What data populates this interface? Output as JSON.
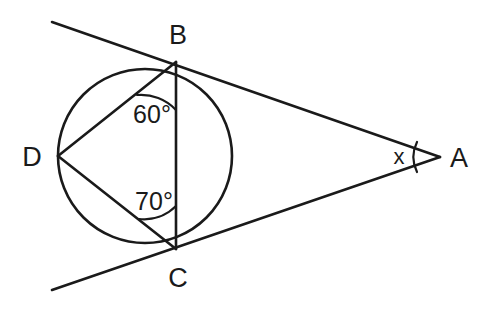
{
  "figure": {
    "type": "circle-geometry-diagram",
    "background_color": "#ffffff",
    "stroke_color": "#1a1a1a"
  },
  "vertices": [
    {
      "id": "B",
      "label": "B",
      "x": 176,
      "y": 62,
      "label_x": 178,
      "label_y": 44,
      "on_circle": true
    },
    {
      "id": "C",
      "label": "C",
      "x": 176,
      "y": 249,
      "label_x": 178,
      "label_y": 287,
      "on_circle": true
    },
    {
      "id": "D",
      "label": "D",
      "x": 58,
      "y": 156,
      "label_x": 32,
      "label_y": 166,
      "on_circle": true
    },
    {
      "id": "A",
      "label": "A",
      "x": 440,
      "y": 157,
      "label_x": 459,
      "label_y": 167,
      "on_circle": false
    }
  ],
  "circle": {
    "center_x": 145,
    "center_y": 156,
    "radius": 87
  },
  "tangents": [
    {
      "id": "tangent-at-B",
      "from_x": 52,
      "from_y": 22,
      "to_x": 440,
      "to_y": 157,
      "touch_point": "B"
    },
    {
      "id": "tangent-at-C",
      "from_x": 52,
      "from_y": 290,
      "to_x": 440,
      "to_y": 157,
      "touch_point": "C"
    }
  ],
  "chords": [
    {
      "id": "chord-BD",
      "from": "B",
      "to": "D",
      "x1": 176,
      "y1": 62,
      "x2": 58,
      "y2": 156
    },
    {
      "id": "chord-DC",
      "from": "D",
      "to": "C",
      "x1": 58,
      "y1": 156,
      "x2": 176,
      "y2": 249
    },
    {
      "id": "chord-BC",
      "from": "B",
      "to": "C",
      "x1": 176,
      "y1": 62,
      "x2": 176,
      "y2": 249
    }
  ],
  "angles": [
    {
      "id": "angle-DBC",
      "at_vertex": "B",
      "label": "60°",
      "value": 60,
      "unit": "degrees",
      "label_x": 152,
      "label_y": 123,
      "arc_path": "M 137 95 A 48 48 0 0 1 176 110"
    },
    {
      "id": "angle-DCB",
      "at_vertex": "C",
      "label": "70°",
      "value": 70,
      "unit": "degrees",
      "label_x": 154,
      "label_y": 210,
      "arc_path": "M 137 216 A 43 43 0 0 0 176 206"
    },
    {
      "id": "angle-A",
      "at_vertex": "A",
      "label": "x",
      "value": null,
      "unit": "unknown",
      "label_x": 399,
      "label_y": 164,
      "arc_path": "M 414 143 A 32 32 0 0 0 414 171"
    }
  ]
}
